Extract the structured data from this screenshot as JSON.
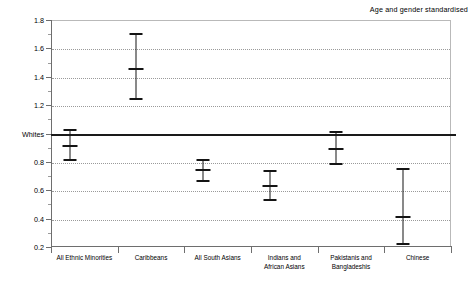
{
  "chart_data": {
    "type": "scatter",
    "title": "",
    "annotation": "Age and gender standardised",
    "xlabel": "",
    "ylabel": "",
    "ylim": [
      0.2,
      1.8
    ],
    "ytick_values": [
      1.8,
      1.6,
      1.4,
      1.2,
      1.0,
      0.8,
      0.6,
      0.4,
      0.2
    ],
    "ytick_labels": [
      "1.8",
      "1.6",
      "1.4",
      "1.2",
      "Whites",
      "0.8",
      "0.6",
      "0.4",
      "0.2"
    ],
    "grid": "horizontal-dotted",
    "legend": "none",
    "reference_line": {
      "value": 1.0,
      "label": "Whites"
    },
    "categories": [
      "All Ethnic Minorities",
      "Caribbeans",
      "All South Asians",
      "Indians and\nAfrican Asians",
      "Pakistanis and\nBangladeshis",
      "Chinese"
    ],
    "series": [
      {
        "name": "Standardised ratio",
        "values": [
          0.92,
          1.46,
          0.75,
          0.64,
          0.9,
          0.42
        ],
        "ci_lower": [
          0.82,
          1.25,
          0.67,
          0.54,
          0.79,
          0.23
        ],
        "ci_upper": [
          1.03,
          1.71,
          0.82,
          0.74,
          1.02,
          0.76
        ]
      }
    ]
  }
}
